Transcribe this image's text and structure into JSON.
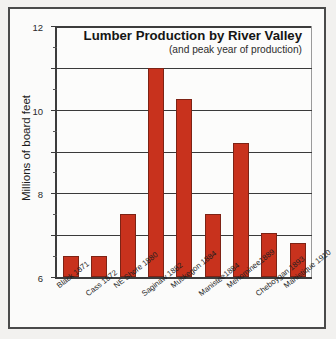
{
  "chart_data": {
    "type": "bar",
    "title": "Lumber Production by River Valley",
    "subtitle": "(and peak year of production)",
    "xlabel": "",
    "ylabel": "Millions of board feet",
    "ylim": [
      0,
      12
    ],
    "yticks": [
      0,
      2,
      4,
      6,
      8,
      10,
      12
    ],
    "ytick_labels": [
      "",
      "2",
      "4",
      "6",
      "8",
      "10",
      "12"
    ],
    "grid": true,
    "legend": "none",
    "bar_color": "#C8321D",
    "bar_edge_color": "#7D2315",
    "categories": [
      "Black 1871",
      "Cass 1872",
      "NE Shore 1880",
      "Saginaw 1882",
      "Muskegon 1884",
      "Manistee1884",
      "Menominee1889",
      "Cheboygan 1893",
      "Manistique 1910"
    ],
    "values": [
      1.0,
      1.0,
      3.0,
      10.0,
      8.5,
      3.0,
      6.4,
      2.1,
      1.65
    ]
  },
  "axis": {
    "y_title": "Millions of board feet"
  },
  "frame": {
    "border_color": "#4A4A4A"
  }
}
